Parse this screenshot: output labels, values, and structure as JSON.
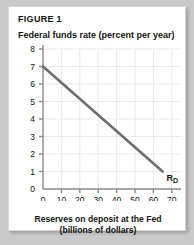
{
  "figure": {
    "label": "FIGURE 1",
    "y_axis_title": "Federal funds rate (percent per year)",
    "x_axis_title_line1": "Reserves on deposit at the Fed",
    "x_axis_title_line2": "(billions of dollars)"
  },
  "colors": {
    "curve": "#6e6e6e",
    "axis": "#8a8a8a",
    "grid": "#e9e9e9",
    "text": "#131313",
    "card_background": "#ffffff",
    "page_background": "#c9c9c9"
  },
  "chart_data": {
    "type": "line",
    "title": "FIGURE 1",
    "xlabel": "Reserves on deposit at the Fed (billions of dollars)",
    "ylabel": "Federal funds rate (percent per year)",
    "xlim": [
      0,
      75
    ],
    "ylim": [
      0,
      8
    ],
    "grid": true,
    "legend": "none",
    "x_ticks": [
      0,
      10,
      20,
      30,
      40,
      50,
      60,
      70
    ],
    "x_tick_labels": [
      "0",
      "10",
      "20",
      "30",
      "40",
      "50",
      "60",
      "70"
    ],
    "y_ticks": [
      0,
      1,
      2,
      3,
      4,
      5,
      6,
      7,
      8
    ],
    "y_tick_labels": [
      "0",
      "1",
      "2",
      "3",
      "4",
      "5",
      "6",
      "7",
      "8"
    ],
    "series": [
      {
        "name": "RD",
        "annotation": "RD",
        "annotation_base": "R",
        "annotation_sub": "D",
        "x": [
          0,
          65
        ],
        "y": [
          7,
          1
        ]
      }
    ]
  }
}
